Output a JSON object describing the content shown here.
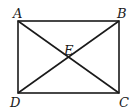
{
  "diagram": {
    "type": "geometry-figure",
    "shape": "rectangle-with-diagonals",
    "stroke_color": "#1a1a1a",
    "vertices": [
      {
        "label": "A",
        "x": 18,
        "y": 21
      },
      {
        "label": "B",
        "x": 119,
        "y": 21
      },
      {
        "label": "C",
        "x": 119,
        "y": 93
      },
      {
        "label": "D",
        "x": 18,
        "y": 93
      }
    ],
    "intersection": {
      "label": "E",
      "x": 68.5,
      "y": 57
    },
    "segments": [
      "AB",
      "BC",
      "CD",
      "DA",
      "AC",
      "BD"
    ],
    "labels": {
      "A": "A",
      "B": "B",
      "C": "C",
      "D": "D",
      "E": "E"
    }
  }
}
